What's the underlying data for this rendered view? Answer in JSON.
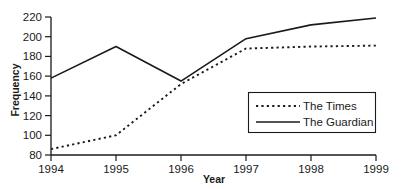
{
  "chart_data": {
    "type": "line",
    "title": "",
    "xlabel": "Year",
    "ylabel": "Frequency",
    "x": [
      1994,
      1995,
      1996,
      1997,
      1998,
      1999
    ],
    "xtick_labels": [
      "1994",
      "1995",
      "1996",
      "1997",
      "1998",
      "1999"
    ],
    "ytick_labels": [
      "80",
      "100",
      "120",
      "140",
      "160",
      "180",
      "200",
      "220"
    ],
    "yticks": [
      80,
      100,
      120,
      140,
      160,
      180,
      200,
      220
    ],
    "ylim": [
      80,
      220
    ],
    "xlim": [
      1994,
      1999
    ],
    "grid": false,
    "legend_position": "center-right",
    "series": [
      {
        "name": "The Times",
        "style": "dotted",
        "color": "#1a1a1a",
        "values": [
          86,
          100,
          152,
          188,
          190,
          191
        ]
      },
      {
        "name": "The Guardian",
        "style": "solid",
        "color": "#1a1a1a",
        "values": [
          158,
          190,
          155,
          198,
          212,
          219
        ]
      }
    ]
  },
  "axes": {
    "y_title": "Frequency",
    "x_title": "Year",
    "y_ticks": [
      {
        "label": "220",
        "value": 220
      },
      {
        "label": "200",
        "value": 200
      },
      {
        "label": "180",
        "value": 180
      },
      {
        "label": "160",
        "value": 160
      },
      {
        "label": "140",
        "value": 140
      },
      {
        "label": "120",
        "value": 120
      },
      {
        "label": "100",
        "value": 100
      },
      {
        "label": "80",
        "value": 80
      }
    ],
    "x_ticks": [
      {
        "label": "1994",
        "value": 1994
      },
      {
        "label": "1995",
        "value": 1995
      },
      {
        "label": "1996",
        "value": 1996
      },
      {
        "label": "1997",
        "value": 1997
      },
      {
        "label": "1998",
        "value": 1998
      },
      {
        "label": "1999",
        "value": 1999
      }
    ]
  },
  "legend": {
    "entries": [
      {
        "label": "The Times",
        "style": "dotted"
      },
      {
        "label": "The Guardian",
        "style": "solid"
      }
    ]
  },
  "colors": {
    "ink": "#1a1a1a",
    "background": "#ffffff"
  }
}
